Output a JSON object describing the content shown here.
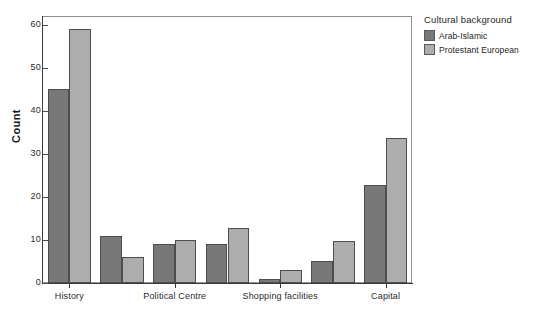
{
  "figure": {
    "clipped_title": "",
    "background_color": "#ffffff"
  },
  "legend": {
    "title": "Cultural background",
    "entries": [
      {
        "label": "Arab-Islamic",
        "color": "#787878"
      },
      {
        "label": "Protestant European",
        "color": "#adadad"
      }
    ]
  },
  "axes": {
    "ylabel": "Count",
    "yticks": [
      "0",
      "10",
      "20",
      "30",
      "40",
      "50",
      "60"
    ],
    "xticks": [
      "History",
      "Political Centre",
      "Shopping facilities",
      "Capital"
    ]
  },
  "chart_data": {
    "type": "bar",
    "title": "",
    "xlabel": "",
    "ylabel": "Count",
    "ylim": [
      0,
      62
    ],
    "grid": false,
    "legend_position": "right",
    "legend_title": "Cultural background",
    "categories": [
      "History",
      "group-2",
      "Political Centre",
      "group-4",
      "Shopping facilities",
      "group-6",
      "Capital"
    ],
    "tick_labels": [
      "History",
      "Political Centre",
      "Shopping facilities",
      "Capital"
    ],
    "tick_label_indices": [
      0,
      2,
      4,
      6
    ],
    "series": [
      {
        "name": "Arab-Islamic",
        "color": "#787878",
        "values": [
          45,
          11,
          9,
          9,
          1,
          5,
          22.7
        ]
      },
      {
        "name": "Protestant European",
        "color": "#adadad",
        "values": [
          59,
          6,
          10,
          12.7,
          3,
          9.8,
          33.7
        ]
      }
    ]
  }
}
